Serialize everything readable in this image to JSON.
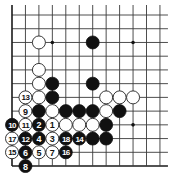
{
  "board": {
    "columns": 12,
    "rows": 12,
    "origin_x": 12,
    "origin_y": 15,
    "spacing_x": 13.45,
    "spacing_y": 13.73,
    "line_extend_right": 8,
    "line_extend_top": 10,
    "edges": [
      "left",
      "bottom"
    ],
    "stone_radius": 6.5,
    "colors": {
      "black": "#111111",
      "white": "#ffffff",
      "line": "#3a3a3a"
    }
  },
  "star_points": [
    {
      "col": 3,
      "row": 2
    },
    {
      "col": 9,
      "row": 2
    },
    {
      "col": 9,
      "row": 8
    }
  ],
  "stones": [
    {
      "col": 2,
      "row": 2,
      "color": "white",
      "label": ""
    },
    {
      "col": 6,
      "row": 2,
      "color": "black",
      "label": ""
    },
    {
      "col": 2,
      "row": 4,
      "color": "white",
      "label": ""
    },
    {
      "col": 2,
      "row": 5,
      "color": "white",
      "label": ""
    },
    {
      "col": 3,
      "row": 5,
      "color": "black",
      "label": ""
    },
    {
      "col": 6,
      "row": 5,
      "color": "black",
      "label": ""
    },
    {
      "col": 1,
      "row": 6,
      "color": "white",
      "label": "13"
    },
    {
      "col": 2,
      "row": 6,
      "color": "white",
      "label": ""
    },
    {
      "col": 3,
      "row": 6,
      "color": "black",
      "label": ""
    },
    {
      "col": 7,
      "row": 6,
      "color": "white",
      "label": ""
    },
    {
      "col": 8,
      "row": 6,
      "color": "white",
      "label": ""
    },
    {
      "col": 9,
      "row": 6,
      "color": "white",
      "label": ""
    },
    {
      "col": 1,
      "row": 7,
      "color": "white",
      "label": "9"
    },
    {
      "col": 2,
      "row": 7,
      "color": "black",
      "label": ""
    },
    {
      "col": 3,
      "row": 7,
      "color": "white",
      "label": ""
    },
    {
      "col": 4,
      "row": 7,
      "color": "black",
      "label": ""
    },
    {
      "col": 5,
      "row": 7,
      "color": "black",
      "label": ""
    },
    {
      "col": 6,
      "row": 7,
      "color": "black",
      "label": ""
    },
    {
      "col": 7,
      "row": 7,
      "color": "white",
      "label": ""
    },
    {
      "col": 8,
      "row": 7,
      "color": "black",
      "label": ""
    },
    {
      "col": 0,
      "row": 8,
      "color": "black",
      "label": "10"
    },
    {
      "col": 1,
      "row": 8,
      "color": "white",
      "label": "11"
    },
    {
      "col": 2,
      "row": 8,
      "color": "black",
      "label": "2"
    },
    {
      "col": 3,
      "row": 8,
      "color": "white",
      "label": "1"
    },
    {
      "col": 4,
      "row": 8,
      "color": "white",
      "label": ""
    },
    {
      "col": 5,
      "row": 8,
      "color": "white",
      "label": ""
    },
    {
      "col": 6,
      "row": 8,
      "color": "white",
      "label": ""
    },
    {
      "col": 7,
      "row": 8,
      "color": "black",
      "label": ""
    },
    {
      "col": 0,
      "row": 9,
      "color": "white",
      "label": "17"
    },
    {
      "col": 1,
      "row": 9,
      "color": "black",
      "label": "12"
    },
    {
      "col": 2,
      "row": 9,
      "color": "black",
      "label": "4"
    },
    {
      "col": 3,
      "row": 9,
      "color": "white",
      "label": "3"
    },
    {
      "col": 4,
      "row": 9,
      "color": "black",
      "label": "18"
    },
    {
      "col": 5,
      "row": 9,
      "color": "black",
      "label": "14"
    },
    {
      "col": 6,
      "row": 9,
      "color": "black",
      "label": ""
    },
    {
      "col": 7,
      "row": 9,
      "color": "black",
      "label": ""
    },
    {
      "col": 0,
      "row": 10,
      "color": "white",
      "label": "15"
    },
    {
      "col": 1,
      "row": 10,
      "color": "black",
      "label": "6"
    },
    {
      "col": 2,
      "row": 10,
      "color": "white",
      "label": "5"
    },
    {
      "col": 3,
      "row": 10,
      "color": "white",
      "label": "7"
    },
    {
      "col": 4,
      "row": 10,
      "color": "black",
      "label": "16"
    },
    {
      "col": 1,
      "row": 11,
      "color": "black",
      "label": "8"
    }
  ]
}
